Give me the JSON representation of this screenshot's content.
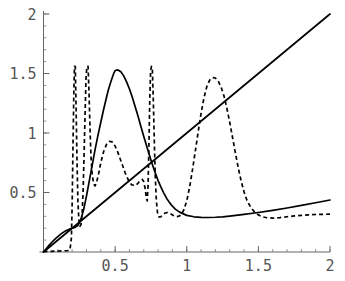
{
  "chart_data": {
    "type": "line",
    "title": "",
    "xlabel": "",
    "ylabel": "",
    "xlim": [
      0,
      2
    ],
    "ylim": [
      0,
      2
    ],
    "grid": false,
    "legend": null,
    "x_ticks": [
      {
        "value": 0.5,
        "label": "0.5"
      },
      {
        "value": 1,
        "label": "1"
      },
      {
        "value": 1.5,
        "label": "1.5"
      },
      {
        "value": 2,
        "label": "2"
      }
    ],
    "y_ticks": [
      {
        "value": 0.5,
        "label": "0.5"
      },
      {
        "value": 1,
        "label": "1"
      },
      {
        "value": 1.5,
        "label": "1.5"
      },
      {
        "value": 2,
        "label": "2"
      }
    ],
    "x_minor_tick_step": 0.1,
    "y_minor_tick_step": 0.1,
    "series": [
      {
        "name": "diagonal-line",
        "style": "solid",
        "color": "#000000",
        "points": [
          [
            0,
            0
          ],
          [
            2,
            2
          ]
        ]
      },
      {
        "name": "solid-curve",
        "style": "solid",
        "color": "#000000",
        "points": [
          [
            0.0,
            0.0
          ],
          [
            0.02,
            0.03
          ],
          [
            0.04,
            0.058
          ],
          [
            0.06,
            0.084
          ],
          [
            0.08,
            0.108
          ],
          [
            0.1,
            0.13
          ],
          [
            0.12,
            0.15
          ],
          [
            0.14,
            0.167
          ],
          [
            0.16,
            0.181
          ],
          [
            0.18,
            0.192
          ],
          [
            0.2,
            0.2
          ],
          [
            0.22,
            0.207
          ],
          [
            0.24,
            0.222
          ],
          [
            0.26,
            0.27
          ],
          [
            0.28,
            0.355
          ],
          [
            0.3,
            0.47
          ],
          [
            0.32,
            0.6
          ],
          [
            0.34,
            0.73
          ],
          [
            0.36,
            0.86
          ],
          [
            0.38,
            0.98
          ],
          [
            0.4,
            1.09
          ],
          [
            0.42,
            1.2
          ],
          [
            0.44,
            1.3
          ],
          [
            0.45,
            1.35
          ],
          [
            0.47,
            1.43
          ],
          [
            0.49,
            1.5
          ],
          [
            0.5,
            1.525
          ],
          [
            0.52,
            1.53
          ],
          [
            0.54,
            1.515
          ],
          [
            0.56,
            1.48
          ],
          [
            0.58,
            1.43
          ],
          [
            0.6,
            1.37
          ],
          [
            0.62,
            1.3
          ],
          [
            0.64,
            1.22
          ],
          [
            0.66,
            1.14
          ],
          [
            0.68,
            1.055
          ],
          [
            0.7,
            0.97
          ],
          [
            0.72,
            0.89
          ],
          [
            0.74,
            0.81
          ],
          [
            0.76,
            0.735
          ],
          [
            0.78,
            0.665
          ],
          [
            0.8,
            0.6
          ],
          [
            0.82,
            0.545
          ],
          [
            0.84,
            0.495
          ],
          [
            0.86,
            0.45
          ],
          [
            0.88,
            0.415
          ],
          [
            0.9,
            0.385
          ],
          [
            0.92,
            0.36
          ],
          [
            0.95,
            0.335
          ],
          [
            1.0,
            0.308
          ],
          [
            1.05,
            0.296
          ],
          [
            1.1,
            0.291
          ],
          [
            1.15,
            0.29
          ],
          [
            1.2,
            0.292
          ],
          [
            1.25,
            0.296
          ],
          [
            1.3,
            0.302
          ],
          [
            1.4,
            0.316
          ],
          [
            1.5,
            0.332
          ],
          [
            1.6,
            0.35
          ],
          [
            1.7,
            0.37
          ],
          [
            1.8,
            0.392
          ],
          [
            1.9,
            0.414
          ],
          [
            2.0,
            0.437
          ]
        ]
      },
      {
        "name": "dashed-curve",
        "style": "dashed",
        "color": "#000000",
        "points": [
          [
            0.0,
            0.004
          ],
          [
            0.05,
            0.006
          ],
          [
            0.1,
            0.008
          ],
          [
            0.14,
            0.01
          ],
          [
            0.17,
            0.012
          ],
          [
            0.185,
            0.02
          ],
          [
            0.195,
            0.12
          ],
          [
            0.2,
            0.4
          ],
          [
            0.206,
            0.9
          ],
          [
            0.212,
            1.35
          ],
          [
            0.216,
            1.56
          ],
          [
            0.222,
            1.56
          ],
          [
            0.228,
            1.18
          ],
          [
            0.234,
            0.76
          ],
          [
            0.24,
            0.43
          ],
          [
            0.247,
            0.27
          ],
          [
            0.254,
            0.215
          ],
          [
            0.262,
            0.23
          ],
          [
            0.27,
            0.33
          ],
          [
            0.277,
            0.53
          ],
          [
            0.284,
            0.85
          ],
          [
            0.291,
            1.2
          ],
          [
            0.297,
            1.47
          ],
          [
            0.303,
            1.56
          ],
          [
            0.311,
            1.56
          ],
          [
            0.318,
            1.33
          ],
          [
            0.325,
            1.02
          ],
          [
            0.332,
            0.79
          ],
          [
            0.34,
            0.65
          ],
          [
            0.35,
            0.572
          ],
          [
            0.36,
            0.555
          ],
          [
            0.37,
            0.582
          ],
          [
            0.385,
            0.66
          ],
          [
            0.4,
            0.75
          ],
          [
            0.42,
            0.845
          ],
          [
            0.44,
            0.905
          ],
          [
            0.46,
            0.93
          ],
          [
            0.48,
            0.925
          ],
          [
            0.5,
            0.89
          ],
          [
            0.52,
            0.835
          ],
          [
            0.545,
            0.75
          ],
          [
            0.57,
            0.665
          ],
          [
            0.595,
            0.598
          ],
          [
            0.615,
            0.565
          ],
          [
            0.635,
            0.558
          ],
          [
            0.655,
            0.572
          ],
          [
            0.675,
            0.6
          ],
          [
            0.69,
            0.61
          ],
          [
            0.7,
            0.59
          ],
          [
            0.71,
            0.53
          ],
          [
            0.718,
            0.45
          ],
          [
            0.724,
            0.43
          ],
          [
            0.73,
            0.56
          ],
          [
            0.736,
            0.9
          ],
          [
            0.742,
            1.29
          ],
          [
            0.748,
            1.53
          ],
          [
            0.754,
            1.56
          ],
          [
            0.76,
            1.53
          ],
          [
            0.766,
            1.3
          ],
          [
            0.773,
            0.96
          ],
          [
            0.78,
            0.64
          ],
          [
            0.788,
            0.43
          ],
          [
            0.796,
            0.33
          ],
          [
            0.806,
            0.295
          ],
          [
            0.818,
            0.295
          ],
          [
            0.83,
            0.31
          ],
          [
            0.845,
            0.325
          ],
          [
            0.86,
            0.332
          ],
          [
            0.875,
            0.33
          ],
          [
            0.89,
            0.32
          ],
          [
            0.905,
            0.308
          ],
          [
            0.92,
            0.3
          ],
          [
            0.935,
            0.298
          ],
          [
            0.95,
            0.303
          ],
          [
            0.965,
            0.32
          ],
          [
            0.98,
            0.355
          ],
          [
            1.0,
            0.43
          ],
          [
            1.02,
            0.545
          ],
          [
            1.04,
            0.69
          ],
          [
            1.06,
            0.85
          ],
          [
            1.08,
            1.01
          ],
          [
            1.1,
            1.165
          ],
          [
            1.12,
            1.295
          ],
          [
            1.14,
            1.39
          ],
          [
            1.16,
            1.445
          ],
          [
            1.18,
            1.465
          ],
          [
            1.2,
            1.462
          ],
          [
            1.22,
            1.435
          ],
          [
            1.24,
            1.385
          ],
          [
            1.26,
            1.31
          ],
          [
            1.28,
            1.21
          ],
          [
            1.3,
            1.09
          ],
          [
            1.32,
            0.96
          ],
          [
            1.34,
            0.83
          ],
          [
            1.36,
            0.705
          ],
          [
            1.38,
            0.595
          ],
          [
            1.4,
            0.505
          ],
          [
            1.42,
            0.435
          ],
          [
            1.445,
            0.378
          ],
          [
            1.47,
            0.34
          ],
          [
            1.5,
            0.312
          ],
          [
            1.53,
            0.295
          ],
          [
            1.56,
            0.288
          ],
          [
            1.6,
            0.285
          ],
          [
            1.65,
            0.289
          ],
          [
            1.7,
            0.296
          ],
          [
            1.75,
            0.303
          ],
          [
            1.8,
            0.308
          ],
          [
            1.85,
            0.312
          ],
          [
            1.9,
            0.315
          ],
          [
            1.95,
            0.317
          ],
          [
            2.0,
            0.318
          ]
        ]
      }
    ]
  }
}
